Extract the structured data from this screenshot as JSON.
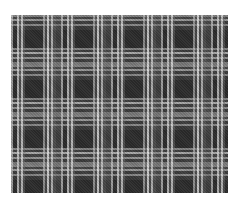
{
  "image": {
    "subject": "black and white tartan plaid fabric swatch",
    "pattern": "tartan",
    "colors": {
      "background": "#ffffff",
      "base_dark": "#2c2c2c",
      "stripe_light": "#dcdcdc",
      "stripe_mid": "#787878"
    },
    "repeat_period_px": 50
  }
}
